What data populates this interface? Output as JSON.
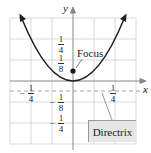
{
  "figure": {
    "axes": {
      "x_label": "x",
      "y_label": "y"
    },
    "equation": "y = 4x^2",
    "annotations": {
      "focus_label": "Focus",
      "directrix_label": "Directrix"
    },
    "ticks": {
      "x": [
        {
          "sign": "-",
          "num": "1",
          "den": "4",
          "value": -0.25
        },
        {
          "sign": "",
          "num": "1",
          "den": "4",
          "value": 0.25
        }
      ],
      "y": [
        {
          "sign": "",
          "num": "1",
          "den": "4",
          "value": 0.25
        },
        {
          "sign": "",
          "num": "1",
          "den": "8",
          "value": 0.125
        },
        {
          "sign": "-",
          "num": "1",
          "den": "8",
          "value": -0.125
        },
        {
          "sign": "-",
          "num": "1",
          "den": "4",
          "value": -0.25
        }
      ]
    },
    "focus": {
      "x": 0,
      "y": 0.0625
    },
    "directrix": {
      "y": -0.0625
    },
    "vertex": {
      "x": 0,
      "y": 0
    },
    "grid": {
      "step": 0.125,
      "x_range": [
        -0.375,
        0.375
      ],
      "y_range": [
        -0.375,
        0.375
      ]
    },
    "colors": {
      "curve": "#222222",
      "grid": "#cccccc",
      "axis": "#888888",
      "box": "#e6e6e6"
    }
  }
}
